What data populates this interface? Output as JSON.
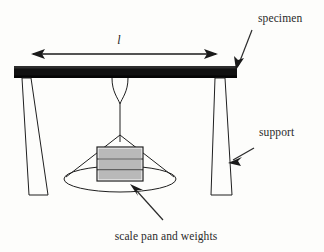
{
  "figure": {
    "background_color": "#fdfdfb",
    "ink_color": "#1a1a1a",
    "weights_fill_color": "#b9b9b9",
    "beam_color": "#111111"
  },
  "labels": {
    "specimen": "specimen",
    "support": "support",
    "scale_pan": "scale pan and weights",
    "span_dimension": "l"
  },
  "annotations": [
    {
      "name": "specimen",
      "text": "specimen",
      "text_x": 258,
      "text_y": 22
    },
    {
      "name": "support",
      "text": "support",
      "text_y": 136,
      "text_x": 259
    },
    {
      "name": "scale-pan-and-weights",
      "text": "scale pan and weights",
      "text_x": 166,
      "text_y": 240
    }
  ],
  "dimension": {
    "symbol": "l",
    "x": 119,
    "y": 44,
    "line_y": 54,
    "left_x": 31,
    "right_x": 218
  },
  "specimen_beam": {
    "left": 14,
    "right": 237,
    "top": 66,
    "bottom": 78
  },
  "supports": [
    {
      "name": "left-support",
      "top_x": 26,
      "bottom_left": 29,
      "bottom_right": 48
    },
    {
      "name": "right-support",
      "top_x": 220,
      "bottom_left": 211,
      "bottom_right": 232
    }
  ],
  "weights": {
    "bands": 3,
    "left": 97,
    "right": 143,
    "top": 147,
    "bottom": 181
  },
  "pan": {
    "center_x": 120,
    "center_y": 179,
    "radius_x": 56,
    "radius_y": 13
  }
}
